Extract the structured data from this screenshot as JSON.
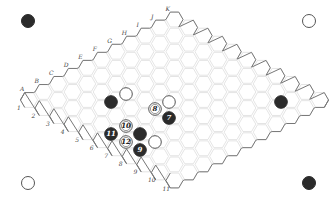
{
  "board": {
    "size": 11,
    "columns": [
      "A",
      "B",
      "C",
      "D",
      "E",
      "F",
      "G",
      "H",
      "I",
      "J",
      "K"
    ],
    "rows": [
      "1",
      "2",
      "3",
      "4",
      "5",
      "6",
      "7",
      "8",
      "9",
      "10",
      "11"
    ],
    "colors": {
      "black": "#2b2b2b",
      "white": "#ffffff",
      "grid": "#dddddd",
      "edge": "#777777"
    }
  },
  "corner_markers": [
    {
      "pos": "top-left",
      "color": "black"
    },
    {
      "pos": "top-right",
      "color": "white"
    },
    {
      "pos": "bottom-left",
      "color": "white"
    },
    {
      "pos": "bottom-right",
      "color": "black"
    }
  ],
  "stones": [
    {
      "x": 111,
      "y": 102,
      "color": "black",
      "label": ""
    },
    {
      "x": 126,
      "y": 94,
      "color": "white",
      "label": ""
    },
    {
      "x": 169,
      "y": 102,
      "color": "white",
      "label": ""
    },
    {
      "x": 155,
      "y": 109,
      "color": "white",
      "label": "8"
    },
    {
      "x": 169,
      "y": 118,
      "color": "black",
      "label": "7"
    },
    {
      "x": 281,
      "y": 102,
      "color": "black",
      "label": ""
    },
    {
      "x": 126,
      "y": 126,
      "color": "white",
      "label": "10"
    },
    {
      "x": 111,
      "y": 134,
      "color": "black",
      "label": "11"
    },
    {
      "x": 140,
      "y": 134,
      "color": "black",
      "label": ""
    },
    {
      "x": 126,
      "y": 142,
      "color": "white",
      "label": "12"
    },
    {
      "x": 155,
      "y": 142,
      "color": "white",
      "label": ""
    },
    {
      "x": 140,
      "y": 150,
      "color": "black",
      "label": "9"
    }
  ]
}
